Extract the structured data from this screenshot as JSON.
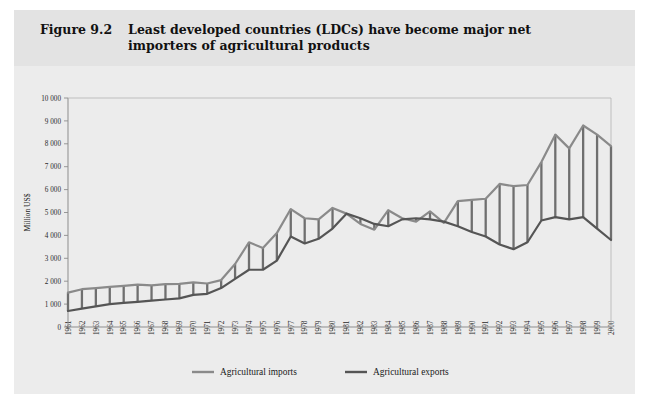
{
  "figure": {
    "label": "Figure 9.2",
    "title": "Least developed countries (LDCs) have become major net importers of agricultural products"
  },
  "legend": {
    "items": [
      {
        "label": "Agricultural imports",
        "color": "#8a8a8a"
      },
      {
        "label": "Agricultural exports",
        "color": "#555555"
      }
    ]
  },
  "colors": {
    "imports_line": "#8a8a8a",
    "exports_line": "#555555",
    "hatch": "#6f6f6f",
    "axis": "#8d8d8d",
    "plot_background": "#ececec",
    "header_background": "#e3e3e3",
    "panel_background": "#e9e9e9",
    "text": "#1a1a1a"
  },
  "chart_data": {
    "type": "line",
    "title": "Least developed countries (LDCs) have become major net importers of agricultural products",
    "xlabel": "",
    "ylabel": "Million US$",
    "ylim": [
      0,
      10000
    ],
    "ytick_step": 1000,
    "ytick_labels": [
      "0",
      "1 000",
      "2 000",
      "3 000",
      "4 000",
      "5 000",
      "6 000",
      "7 000",
      "8 000",
      "9 000",
      "10 000"
    ],
    "grid": false,
    "legend_position": "bottom-center",
    "annotation": "Vertical hatch lines connect the imports and exports series each year, shading the gap between them.",
    "categories": [
      "1961",
      "1962",
      "1963",
      "1964",
      "1965",
      "1966",
      "1967",
      "1968",
      "1969",
      "1970",
      "1971",
      "1972",
      "1973",
      "1974",
      "1975",
      "1976",
      "1977",
      "1978",
      "1979",
      "1980",
      "1981",
      "1982",
      "1983",
      "1984",
      "1985",
      "1986",
      "1987",
      "1988",
      "1989",
      "1990",
      "1991",
      "1992",
      "1993",
      "1994",
      "1995",
      "1996",
      "1997",
      "1998",
      "1999",
      "2000"
    ],
    "series": [
      {
        "name": "Agricultural imports",
        "color": "#8a8a8a",
        "values": [
          1500,
          1650,
          1700,
          1750,
          1800,
          1850,
          1820,
          1870,
          1880,
          1950,
          1900,
          2050,
          2750,
          3700,
          3450,
          4100,
          5150,
          4750,
          4700,
          5200,
          4950,
          4500,
          4250,
          5100,
          4750,
          4600,
          5050,
          4550,
          5500,
          5550,
          5600,
          6250,
          6150,
          6200,
          7200,
          8400,
          7800,
          8800,
          8400,
          7900
        ]
      },
      {
        "name": "Agricultural exports",
        "color": "#555555",
        "values": [
          700,
          800,
          900,
          1000,
          1050,
          1100,
          1150,
          1200,
          1250,
          1400,
          1450,
          1700,
          2100,
          2500,
          2500,
          2900,
          3950,
          3650,
          3850,
          4300,
          4950,
          4750,
          4500,
          4400,
          4700,
          4750,
          4700,
          4600,
          4400,
          4150,
          3950,
          3600,
          3400,
          3700,
          4650,
          4800,
          4700,
          4800,
          4300,
          3800
        ]
      }
    ]
  }
}
